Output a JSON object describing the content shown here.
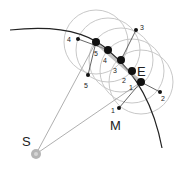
{
  "diagram": {
    "labels": {
      "sun": "S",
      "earth": "E",
      "moon": "M"
    },
    "earth_position_numbers": [
      "1",
      "2",
      "3",
      "4",
      "5"
    ],
    "moon_position_numbers": [
      "1",
      "2",
      "3",
      "4",
      "5"
    ],
    "colors": {
      "orbit": "#222222",
      "circles": "#c8c8c8",
      "lines": "#9a9a9a",
      "sun": "#b5b5b5",
      "dots": "#111111"
    }
  }
}
